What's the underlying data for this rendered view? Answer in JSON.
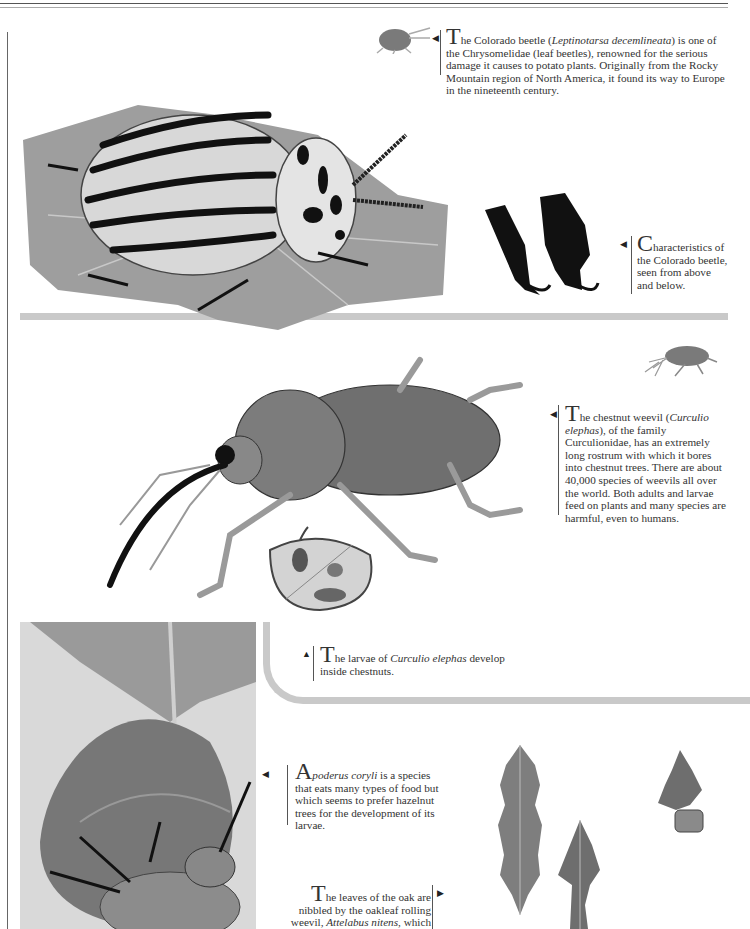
{
  "page": {
    "type": "encyclopedia page"
  },
  "captions": {
    "colorado_beetle": {
      "drop_cap": "T",
      "lead": "he Colorado beetle (",
      "italic": "Leptinotarsa decemlineata",
      "rest": ") is one of the Chrysomelidae (leaf beetles), renowned for the serious damage it causes to potato plants. Originally from the Rocky Mountain region of North America, it found its way to Europe in the nineteenth century.",
      "arrow": "◀"
    },
    "colorado_legs": {
      "drop_cap": "C",
      "text": "haracteristics of the Colorado beetle, seen from above and below.",
      "arrow": "◀"
    },
    "chestnut_weevil": {
      "drop_cap": "T",
      "lead": "he chestnut weevil (",
      "italic": "Curculio elephas",
      "rest": "), of the family Curculionidae, has an extremely long rostrum with which it bores into chestnut trees. There are about 40,000 species of weevils all over the world. Both adults and larvae feed on plants and many species are harmful, even to humans.",
      "arrow": "◀"
    },
    "larvae": {
      "drop_cap": "T",
      "lead": "he larvae of ",
      "italic": "Curculio elephas",
      "rest": " develop inside chestnuts.",
      "arrow": "▲"
    },
    "apoderus": {
      "drop_cap": "A",
      "italic": "poderus coryli",
      "rest": " is a species that eats many types of food but which seems to prefer hazelnut trees for the development of its larvae.",
      "arrow": "◀"
    },
    "oak_weevil": {
      "drop_cap": "T",
      "lead": "he leaves of the oak are nibbled by the oakleaf rolling weevil, ",
      "italic": "Attelabus nitens",
      "rest": ", which",
      "arrow": "▶"
    }
  },
  "illustrations": [
    {
      "id": "colorado-beetle",
      "label": "Colorado beetle on potato leaf"
    },
    {
      "id": "colorado-beetle-legs",
      "label": "Colorado beetle legs, above and below"
    },
    {
      "id": "colorado-beetle-silhouette",
      "label": "Colorado beetle silhouette"
    },
    {
      "id": "chestnut-weevil",
      "label": "Chestnut weevil"
    },
    {
      "id": "chestnut-weevil-silhouette",
      "label": "Chestnut weevil silhouette"
    },
    {
      "id": "chestnut-cross-section",
      "label": "Chestnut with larva"
    },
    {
      "id": "apoderus-coryli",
      "label": "Apoderus coryli on hazel leaf"
    },
    {
      "id": "oak-leaves",
      "label": "Oak leaves rolled by weevil"
    }
  ],
  "colors": {
    "band": "#c9c9c9",
    "text": "#2a2a2a",
    "leaf": "#8a8a8a"
  }
}
